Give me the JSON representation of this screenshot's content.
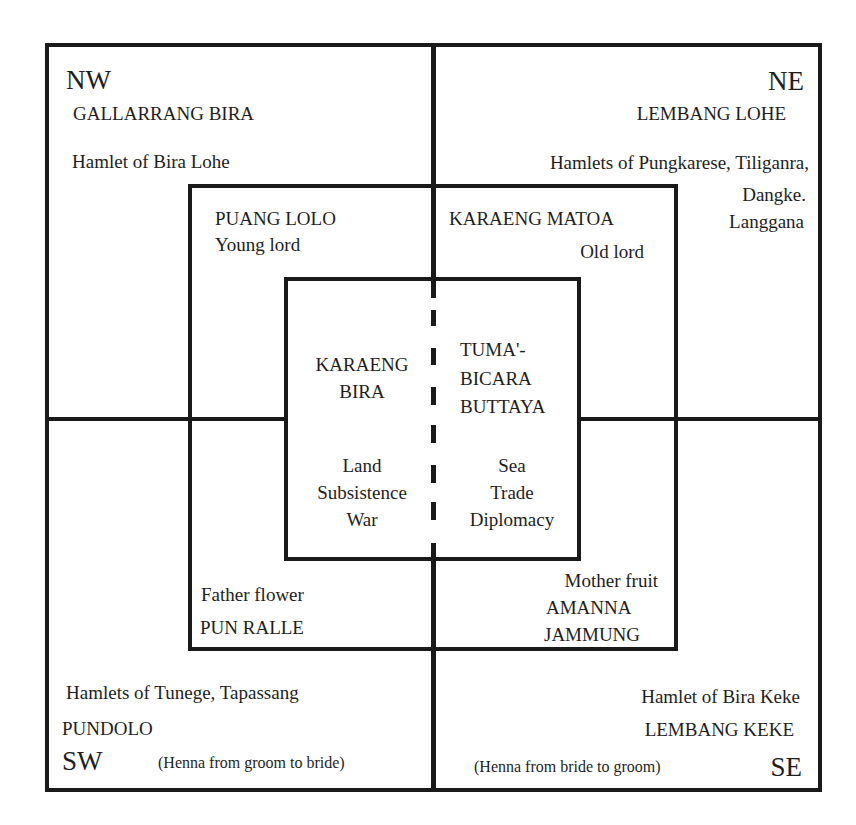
{
  "diagram": {
    "type": "concentric-quadrant-diagram",
    "colors": {
      "line": "#1a1a1a",
      "text": "#1e1e1e",
      "background": "#ffffff"
    },
    "quadrants": {
      "nw": {
        "direction": "NW",
        "title": "GALLARRANG BIRA",
        "subtitle": "Hamlet of Bira Lohe"
      },
      "ne": {
        "direction": "NE",
        "title": "LEMBANG LOHE",
        "subtitle_line1": "Hamlets of Pungkarese, Tiliganra,",
        "subtitle_line2": "Dangke.",
        "subtitle_line3": "Langgana"
      },
      "sw": {
        "direction": "SW",
        "subtitle": "Hamlets of Tunege, Tapassang",
        "title": "PUNDOLO",
        "note": "(Henna from groom to bride)"
      },
      "se": {
        "direction": "SE",
        "subtitle": "Hamlet of Bira Keke",
        "title": "LEMBANG KEKE",
        "note": "(Henna from bride to groom)"
      }
    },
    "middle_ring": {
      "nw": {
        "title": "PUANG LOLO",
        "subtitle": "Young lord"
      },
      "ne": {
        "title": "KARAENG MATOA",
        "subtitle": "Old lord"
      },
      "sw": {
        "subtitle": "Father flower",
        "title": "PUN RALLE"
      },
      "se": {
        "subtitle": "Mother fruit",
        "title_line1": "AMANNA",
        "title_line2": "JAMMUNG"
      }
    },
    "center": {
      "left": {
        "title_line1": "KARAENG",
        "title_line2": "BIRA",
        "attr_line1": "Land",
        "attr_line2": "Subsistence",
        "attr_line3": "War"
      },
      "right": {
        "title_line1": "TUMA'-",
        "title_line2": "BICARA",
        "title_line3": "BUTTAYA",
        "attr_line1": "Sea",
        "attr_line2": "Trade",
        "attr_line3": "Diplomacy"
      }
    }
  }
}
